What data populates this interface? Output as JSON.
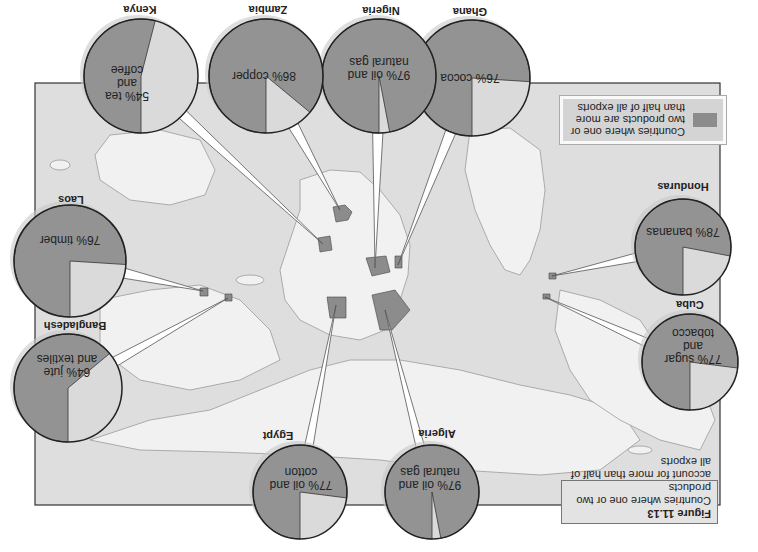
{
  "figure": {
    "number": "Figure 11.13",
    "caption_line1": "Countries where one or two products",
    "caption_line2": "account for more than half of all exports",
    "orientation": "rotated 180 degrees"
  },
  "legend": {
    "text": "Countries where one or two products are more than half of all exports",
    "swatch_color": "#8c8c8c"
  },
  "colors": {
    "highlight_country": "#8c8c8c",
    "land": "#f2f2f2",
    "ocean": "#dedede",
    "pie_major": "#939393",
    "pie_minor": "#dadada",
    "border": "#222222"
  },
  "chart_data": {
    "type": "pie",
    "title": "Countries where one or two products account for more than half of all exports",
    "series": [
      {
        "country": "Ghana",
        "label": "76% cocoa",
        "value": 76
      },
      {
        "country": "Nigeria",
        "label": "97% oil and natural gas",
        "value": 97
      },
      {
        "country": "Zambia",
        "label": "86% copper",
        "value": 86
      },
      {
        "country": "Kenya",
        "label": "54% tea and coffee",
        "value": 54
      },
      {
        "country": "Laos",
        "label": "76% timber",
        "value": 76
      },
      {
        "country": "Bangladesh",
        "label": "64% jute and textiles",
        "value": 64
      },
      {
        "country": "Egypt",
        "label": "77% oil and cotton",
        "value": 77
      },
      {
        "country": "Algeria",
        "label": "97% oil and natural gas",
        "value": 97
      },
      {
        "country": "Cuba",
        "label": "77% sugar and tobacco",
        "value": 77
      },
      {
        "country": "Honduras",
        "label": "78% bananas",
        "value": 78
      }
    ]
  },
  "pies": [
    {
      "country": "Ghana",
      "text": "76% cocoa",
      "value": 76,
      "cx": 472,
      "cy": 78,
      "r": 58,
      "lx": 470,
      "ly": 12,
      "tx": 470,
      "ty": 77,
      "target": [
        398,
        265
      ]
    },
    {
      "country": "Nigeria",
      "text": "97% oil and\nnatural gas",
      "value": 97,
      "cx": 379,
      "cy": 76,
      "r": 57,
      "lx": 381,
      "ly": 11,
      "tx": 379,
      "ty": 68,
      "target": [
        375,
        268
      ]
    },
    {
      "country": "Zambia",
      "text": "86% copper",
      "value": 86,
      "cx": 266,
      "cy": 76,
      "r": 57,
      "lx": 268,
      "ly": 10,
      "tx": 264,
      "ty": 75,
      "target": [
        340,
        210
      ]
    },
    {
      "country": "Kenya",
      "text": "54% tea\nand\ncoffee",
      "value": 54,
      "cx": 141,
      "cy": 76,
      "r": 57,
      "lx": 140,
      "ly": 10,
      "tx": 127,
      "ty": 82,
      "target": [
        323,
        244
      ]
    },
    {
      "country": "Laos",
      "text": "76% timber",
      "value": 76,
      "cx": 70,
      "cy": 261,
      "r": 56,
      "lx": 71,
      "ly": 200,
      "tx": 70,
      "ty": 239,
      "target": [
        203,
        291
      ]
    },
    {
      "country": "Bangladesh",
      "text": "64% jute\nand textiles",
      "value": 64,
      "cx": 68,
      "cy": 388,
      "r": 54,
      "lx": 75,
      "ly": 326,
      "tx": 67,
      "ty": 365,
      "target": [
        228,
        298
      ]
    },
    {
      "country": "Egypt",
      "text": "77% oil and\ncotton",
      "value": 77,
      "cx": 300,
      "cy": 492,
      "r": 47,
      "lx": 278,
      "ly": 436,
      "tx": 301,
      "ty": 478,
      "target": [
        336,
        305
      ]
    },
    {
      "country": "Algeria",
      "text": "97% oil and\nnatural gas",
      "value": 97,
      "cx": 432,
      "cy": 492,
      "r": 47,
      "lx": 437,
      "ly": 434,
      "tx": 430,
      "ty": 478,
      "target": [
        385,
        310
      ]
    },
    {
      "country": "Cuba",
      "text": "77% sugar\nand tobacco",
      "value": 77,
      "cx": 690,
      "cy": 362,
      "r": 48,
      "lx": 690,
      "ly": 305,
      "tx": 693,
      "ty": 345,
      "target": [
        545,
        297
      ]
    },
    {
      "country": "Honduras",
      "text": "78% bananas",
      "value": 78,
      "cx": 683,
      "cy": 247,
      "r": 48,
      "lx": 683,
      "ly": 187,
      "tx": 683,
      "ty": 231,
      "target": [
        552,
        276
      ]
    }
  ]
}
